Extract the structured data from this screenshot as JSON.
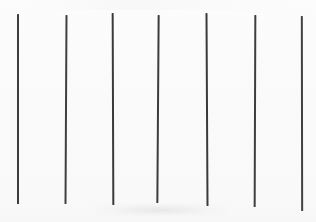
{
  "stimulus": {
    "name": "vertical-line-array",
    "background_color": "#fafafa",
    "line_color": "#3a3a3a",
    "canvas_width": 316,
    "canvas_height": 222,
    "line_count": 7,
    "alt_text": "Seven near-vertical dark lines of similar length evenly spaced across a light background",
    "lines": [
      {
        "id": "line-1",
        "x": 18,
        "top": 14,
        "bottom": 204,
        "length": 190,
        "width": 2.0,
        "tilt_deg": 0.0,
        "color": "#3d3d3d"
      },
      {
        "id": "line-2",
        "x": 66,
        "top": 15,
        "bottom": 204,
        "length": 189,
        "width": 1.8,
        "tilt_deg": 0.3,
        "color": "#3f3f3f"
      },
      {
        "id": "line-3",
        "x": 113,
        "top": 13,
        "bottom": 205,
        "length": 192,
        "width": 2.0,
        "tilt_deg": -0.2,
        "color": "#3a3a3a"
      },
      {
        "id": "line-4",
        "x": 158,
        "top": 15,
        "bottom": 203,
        "length": 188,
        "width": 1.9,
        "tilt_deg": 0.4,
        "color": "#3c3c3c"
      },
      {
        "id": "line-5",
        "x": 207,
        "top": 13,
        "bottom": 206,
        "length": 193,
        "width": 2.0,
        "tilt_deg": -0.3,
        "color": "#3a3a3a"
      },
      {
        "id": "line-6",
        "x": 255,
        "top": 15,
        "bottom": 207,
        "length": 192,
        "width": 1.9,
        "tilt_deg": 0.2,
        "color": "#3e3e3e"
      },
      {
        "id": "line-7",
        "x": 302,
        "top": 16,
        "bottom": 211,
        "length": 195,
        "width": 1.8,
        "tilt_deg": -0.1,
        "color": "#414141"
      }
    ]
  }
}
